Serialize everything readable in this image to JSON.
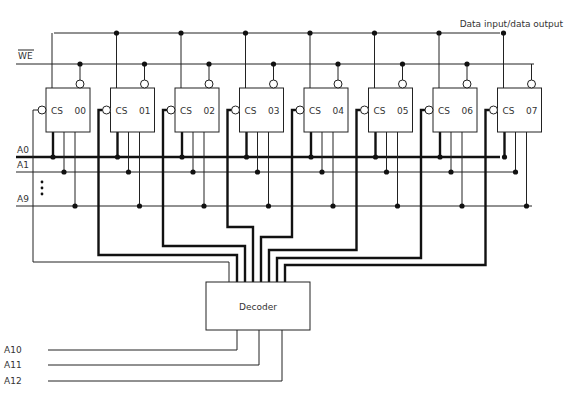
{
  "diagram": {
    "data_bus_label": "Data input/data output",
    "we_label": "WE",
    "address_labels": [
      "A0",
      "A1",
      "A9"
    ],
    "ellipsis": "⋮",
    "chips": [
      {
        "cs": "CS",
        "id": "00"
      },
      {
        "cs": "CS",
        "id": "01"
      },
      {
        "cs": "CS",
        "id": "02"
      },
      {
        "cs": "CS",
        "id": "03"
      },
      {
        "cs": "CS",
        "id": "04"
      },
      {
        "cs": "CS",
        "id": "05"
      },
      {
        "cs": "CS",
        "id": "06"
      },
      {
        "cs": "CS",
        "id": "07"
      }
    ],
    "decoder_label": "Decoder",
    "decoder_inputs": [
      "A10",
      "A11",
      "A12"
    ]
  }
}
